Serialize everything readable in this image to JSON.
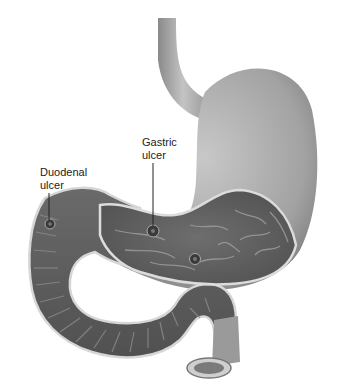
{
  "diagram": {
    "type": "anatomical-illustration",
    "labels": [
      {
        "id": "duodenal",
        "line1": "Duodenal",
        "line2": "ulcer"
      },
      {
        "id": "gastric",
        "line1": "Gastric",
        "line2": "ulcer"
      }
    ],
    "colors": {
      "background": "#ffffff",
      "outer_tissue": "#9a9a9a",
      "inner_mucosa": "#5e5e5e",
      "wall_edge": "#d8d8d8",
      "label_text": "#222222"
    }
  }
}
